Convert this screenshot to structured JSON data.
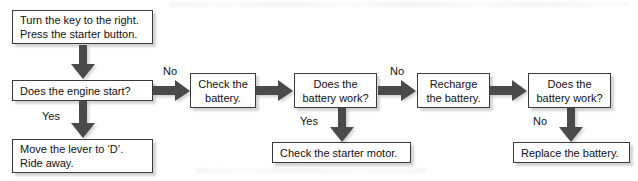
{
  "diagram": {
    "colors": {
      "background": "#ffffff",
      "box_border": "#3a3a3a",
      "box_fill": "#ffffff",
      "arrow_fill": "#4a4a4a",
      "text": "#111111"
    },
    "nodes": [
      {
        "id": "start-instruction",
        "name": "turn-the-key-box",
        "lines": [
          "Turn the key to the right.",
          "Press the starter button."
        ],
        "align": "left"
      },
      {
        "id": "engine-start-question",
        "name": "does-the-engine-start-box",
        "lines": [
          "Does the engine start?"
        ],
        "align": "left"
      },
      {
        "id": "ride-away",
        "name": "move-the-lever-box",
        "lines": [
          "Move the lever to ‘D’.",
          "Ride away."
        ],
        "align": "left"
      },
      {
        "id": "check-battery",
        "name": "check-the-battery-box",
        "lines": [
          "Check the",
          "battery."
        ],
        "align": "center"
      },
      {
        "id": "battery-work-question-1",
        "name": "does-the-battery-work-box-1",
        "lines": [
          "Does the",
          "battery work?"
        ],
        "align": "center"
      },
      {
        "id": "check-starter-motor",
        "name": "check-the-starter-motor-box",
        "lines": [
          "Check the starter motor."
        ],
        "align": "left"
      },
      {
        "id": "recharge-battery",
        "name": "recharge-the-battery-box",
        "lines": [
          "Recharge",
          "the battery."
        ],
        "align": "center"
      },
      {
        "id": "battery-work-question-2",
        "name": "does-the-battery-work-box-2",
        "lines": [
          "Does the",
          "battery work?"
        ],
        "align": "center"
      },
      {
        "id": "replace-battery",
        "name": "replace-the-battery-box",
        "lines": [
          "Replace the battery."
        ],
        "align": "left"
      }
    ],
    "edge_labels": {
      "engine_no": "No",
      "engine_yes": "Yes",
      "battery1_yes": "Yes",
      "battery1_no": "No",
      "battery2_no": "No"
    }
  }
}
